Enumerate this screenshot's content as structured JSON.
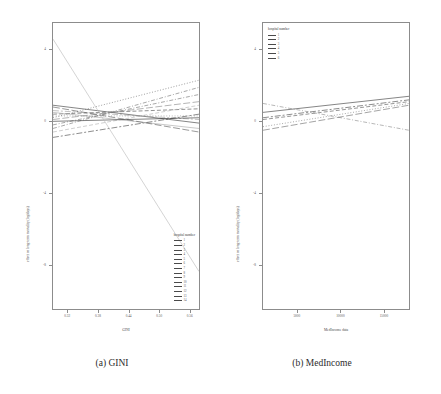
{
  "figure": {
    "subfigures": [
      {
        "id": "a",
        "caption": "(a) GINI"
      },
      {
        "id": "b",
        "caption": "(b) MedIncome"
      }
    ]
  },
  "chart_data": [
    {
      "id": "panel-a",
      "type": "line",
      "title": "",
      "xlabel": "GINI",
      "ylabel": "effect on long-term mortality (log/days)",
      "xlim": [
        0.29,
        0.58
      ],
      "ylim": [
        -10.5,
        5.5
      ],
      "xticks": [
        0.32,
        0.38,
        0.44,
        0.5,
        0.56
      ],
      "xticklabels": [
        "0.32",
        "0.38",
        "0.44",
        "0.50",
        "0.56"
      ],
      "yticks": [
        4,
        0,
        -4,
        -8
      ],
      "yticklabels": [
        "4",
        "0",
        "-4",
        "-8"
      ],
      "grid": false,
      "legend_position": "bottom-right",
      "legend_title": "hospital number",
      "legend_entries": [
        {
          "label": "1",
          "color": "#3a3a3a",
          "dash": "solid"
        },
        {
          "label": "2",
          "color": "#4d4d4d",
          "dash": "dash"
        },
        {
          "label": "3",
          "color": "#606060",
          "dash": "dot"
        },
        {
          "label": "4",
          "color": "#737373",
          "dash": "dashdot"
        },
        {
          "label": "5",
          "color": "#868686",
          "dash": "longdash"
        },
        {
          "label": "6",
          "color": "#999999",
          "dash": "twodash"
        },
        {
          "label": "7",
          "color": "#a6a6a6",
          "dash": "solid"
        },
        {
          "label": "8",
          "color": "#b0b0b0",
          "dash": "dash"
        },
        {
          "label": "9",
          "color": "#8a8a8a",
          "dash": "dot"
        },
        {
          "label": "10",
          "color": "#707070",
          "dash": "dashdot"
        },
        {
          "label": "11",
          "color": "#585858",
          "dash": "longdash"
        },
        {
          "label": "12",
          "color": "#444444",
          "dash": "twodash"
        },
        {
          "label": "13",
          "color": "#333333",
          "dash": "solid"
        },
        {
          "label": "14",
          "color": "#2b2b2b",
          "dash": "dash"
        }
      ],
      "series": [
        {
          "name": "1",
          "x": [
            0.29,
            0.58
          ],
          "y": [
            0.9,
            -0.1
          ],
          "color": "#3a3a3a",
          "dash": "solid"
        },
        {
          "name": "2",
          "x": [
            0.29,
            0.58
          ],
          "y": [
            0.4,
            0.7
          ],
          "color": "#4d4d4d",
          "dash": "dash"
        },
        {
          "name": "3",
          "x": [
            0.29,
            0.58
          ],
          "y": [
            0.2,
            2.3
          ],
          "color": "#606060",
          "dash": "dot"
        },
        {
          "name": "4",
          "x": [
            0.29,
            0.58
          ],
          "y": [
            -0.4,
            1.9
          ],
          "color": "#737373",
          "dash": "dashdot"
        },
        {
          "name": "5",
          "x": [
            0.29,
            0.58
          ],
          "y": [
            0.1,
            1.1
          ],
          "color": "#868686",
          "dash": "longdash"
        },
        {
          "name": "6",
          "x": [
            0.29,
            0.58
          ],
          "y": [
            0.6,
            0.1
          ],
          "color": "#999999",
          "dash": "twodash"
        },
        {
          "name": "7",
          "x": [
            0.29,
            0.58
          ],
          "y": [
            0.5,
            -0.4
          ],
          "color": "#a6a6a6",
          "dash": "solid"
        },
        {
          "name": "8",
          "x": [
            0.29,
            0.58
          ],
          "y": [
            -0.6,
            0.9
          ],
          "color": "#b0b0b0",
          "dash": "dash"
        },
        {
          "name": "9",
          "x": [
            0.29,
            0.58
          ],
          "y": [
            0.3,
            0.3
          ],
          "color": "#8a8a8a",
          "dash": "dot"
        },
        {
          "name": "10",
          "x": [
            0.29,
            0.58
          ],
          "y": [
            -0.2,
            1.5
          ],
          "color": "#707070",
          "dash": "dashdot"
        },
        {
          "name": "11",
          "x": [
            0.29,
            0.58
          ],
          "y": [
            0.8,
            -0.6
          ],
          "color": "#585858",
          "dash": "longdash"
        },
        {
          "name": "12",
          "x": [
            0.29,
            0.58
          ],
          "y": [
            -0.9,
            0.4
          ],
          "color": "#444444",
          "dash": "twodash"
        },
        {
          "name": "13",
          "x": [
            0.29,
            0.58
          ],
          "y": [
            0.0,
            0.2
          ],
          "color": "#333333",
          "dash": "solid"
        },
        {
          "name": "14",
          "x": [
            0.29,
            0.58
          ],
          "y": [
            4.6,
            -8.4
          ],
          "color": "#b8b8b8",
          "dash": "solid"
        }
      ]
    },
    {
      "id": "panel-b",
      "type": "line",
      "title": "",
      "xlabel": "MedIncome data",
      "ylabel": "effect on long-term mortality (log/days)",
      "xlim": [
        1000,
        18000
      ],
      "ylim": [
        -10.5,
        5.5
      ],
      "xticks": [
        5000,
        10000,
        15000
      ],
      "xticklabels": [
        "5000",
        "10000",
        "15000"
      ],
      "yticks": [
        4,
        0,
        -4,
        -8
      ],
      "yticklabels": [
        "4",
        "0",
        "-4",
        "-8"
      ],
      "grid": false,
      "legend_position": "top-left",
      "legend_title": "hospital number",
      "legend_entries": [
        {
          "label": "1",
          "color": "#3a3a3a",
          "dash": "solid"
        },
        {
          "label": "2",
          "color": "#555555",
          "dash": "dash"
        },
        {
          "label": "3",
          "color": "#707070",
          "dash": "dot"
        },
        {
          "label": "4",
          "color": "#8a8a8a",
          "dash": "dashdot"
        },
        {
          "label": "5",
          "color": "#6a6a6a",
          "dash": "longdash"
        },
        {
          "label": "6",
          "color": "#444444",
          "dash": "twodash"
        }
      ],
      "series": [
        {
          "name": "1",
          "x": [
            1000,
            18000
          ],
          "y": [
            0.5,
            1.4
          ],
          "color": "#3a3a3a",
          "dash": "solid"
        },
        {
          "name": "2",
          "x": [
            1000,
            18000
          ],
          "y": [
            0.1,
            1.1
          ],
          "color": "#555555",
          "dash": "dash"
        },
        {
          "name": "3",
          "x": [
            1000,
            18000
          ],
          "y": [
            -0.3,
            1.0
          ],
          "color": "#707070",
          "dash": "dot"
        },
        {
          "name": "4",
          "x": [
            1000,
            18000
          ],
          "y": [
            1.0,
            -0.5
          ],
          "color": "#8a8a8a",
          "dash": "dashdot"
        },
        {
          "name": "5",
          "x": [
            1000,
            18000
          ],
          "y": [
            -0.5,
            0.9
          ],
          "color": "#6a6a6a",
          "dash": "longdash"
        },
        {
          "name": "6",
          "x": [
            1000,
            18000
          ],
          "y": [
            0.2,
            1.2
          ],
          "color": "#444444",
          "dash": "twodash"
        }
      ]
    }
  ]
}
